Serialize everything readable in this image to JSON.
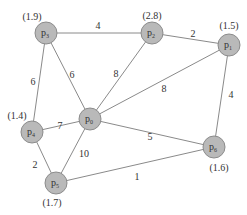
{
  "diagram": {
    "type": "weighted-undirected-graph",
    "nodes": [
      {
        "id": "p3",
        "label": "p",
        "sub": "3",
        "value": "(1.9)",
        "x": 46,
        "y": 33,
        "vx": 32,
        "vy": 20
      },
      {
        "id": "p2",
        "label": "p",
        "sub": "2",
        "value": "(2.8)",
        "x": 152,
        "y": 33,
        "vx": 152,
        "vy": 19
      },
      {
        "id": "p1",
        "label": "p",
        "sub": "1",
        "value": "(1.5)",
        "x": 229,
        "y": 45,
        "vx": 229,
        "vy": 29
      },
      {
        "id": "p4",
        "label": "p",
        "sub": "4",
        "value": "(1.4)",
        "x": 32,
        "y": 132,
        "vx": 17,
        "vy": 119
      },
      {
        "id": "p0",
        "label": "p",
        "sub": "0",
        "value": "",
        "x": 90,
        "y": 119,
        "vx": 0,
        "vy": 0
      },
      {
        "id": "p5",
        "label": "p",
        "sub": "5",
        "value": "(1.7)",
        "x": 56,
        "y": 183,
        "vx": 52,
        "vy": 206
      },
      {
        "id": "p6",
        "label": "p",
        "sub": "6",
        "value": "(1.6)",
        "x": 214,
        "y": 147,
        "vx": 219,
        "vy": 171
      }
    ],
    "edges": [
      {
        "from": "p3",
        "to": "p2",
        "weight": "4",
        "lx": 98,
        "ly": 29
      },
      {
        "from": "p2",
        "to": "p1",
        "weight": "2",
        "lx": 193,
        "ly": 37
      },
      {
        "from": "p3",
        "to": "p4",
        "weight": "6",
        "lx": 33,
        "ly": 85
      },
      {
        "from": "p3",
        "to": "p0",
        "weight": "6",
        "lx": 72,
        "ly": 78
      },
      {
        "from": "p2",
        "to": "p0",
        "weight": "8",
        "lx": 116,
        "ly": 77
      },
      {
        "from": "p1",
        "to": "p0",
        "weight": "8",
        "lx": 164,
        "ly": 92
      },
      {
        "from": "p1",
        "to": "p6",
        "weight": "4",
        "lx": 231,
        "ly": 98
      },
      {
        "from": "p4",
        "to": "p0",
        "weight": "7",
        "lx": 60,
        "ly": 129
      },
      {
        "from": "p0",
        "to": "p6",
        "weight": "5",
        "lx": 150,
        "ly": 140
      },
      {
        "from": "p4",
        "to": "p5",
        "weight": "2",
        "lx": 35,
        "ly": 168
      },
      {
        "from": "p0",
        "to": "p5",
        "weight": "10",
        "lx": 84,
        "ly": 157
      },
      {
        "from": "p5",
        "to": "p6",
        "weight": "1",
        "lx": 137,
        "ly": 180
      }
    ]
  }
}
